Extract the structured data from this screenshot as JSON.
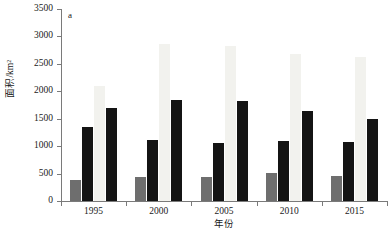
{
  "panel": {
    "label": "a"
  },
  "axes": {
    "y_title": "面积/km²",
    "x_title": "年份"
  },
  "chart_data": {
    "type": "bar",
    "title": "a",
    "xlabel": "年份",
    "ylabel": "面积/km²",
    "ylim": [
      0,
      3500
    ],
    "ytick_labels": [
      "0",
      "500",
      "1000",
      "1500",
      "2000",
      "2500",
      "3000",
      "3500"
    ],
    "yticks": [
      0,
      500,
      1000,
      1500,
      2000,
      2500,
      3000,
      3500
    ],
    "grid": false,
    "legend": "none",
    "categories": [
      "1995",
      "2000",
      "2005",
      "2010",
      "2015"
    ],
    "series": [
      {
        "name": "series-1",
        "color": "#6e6e6e",
        "values": [
          390,
          430,
          440,
          510,
          460
        ]
      },
      {
        "name": "series-2",
        "color": "#141414",
        "values": [
          1350,
          1120,
          1060,
          1090,
          1070
        ]
      },
      {
        "name": "series-3",
        "color": "#f2f2ee",
        "values": [
          2100,
          2870,
          2830,
          2680,
          2620
        ]
      },
      {
        "name": "series-4",
        "color": "#141414",
        "values": [
          1690,
          1840,
          1830,
          1650,
          1490
        ]
      }
    ]
  }
}
